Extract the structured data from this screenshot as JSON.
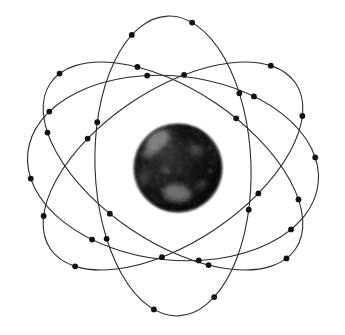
{
  "figure": {
    "kind": "rutherford-bohr-atom",
    "background_color": "#ffffff",
    "canvas": {
      "width": 345,
      "height": 335
    }
  },
  "nucleus": {
    "label": "nucleus",
    "center_x": 178,
    "center_y": 168,
    "radius": 44,
    "fill_color": "#141414",
    "highlight_color": "#9a9a9a",
    "texture": "mottled-grainy-sphere",
    "highlights": [
      {
        "cx": 158,
        "cy": 140,
        "rx": 13,
        "ry": 9,
        "rot": -35,
        "opacity": 0.42
      },
      {
        "cx": 150,
        "cy": 152,
        "rx": 8,
        "ry": 5,
        "rot": -20,
        "opacity": 0.3
      },
      {
        "cx": 177,
        "cy": 193,
        "rx": 14,
        "ry": 9,
        "rot": 8,
        "opacity": 0.38
      },
      {
        "cx": 196,
        "cy": 150,
        "rx": 7,
        "ry": 5,
        "rot": 30,
        "opacity": 0.2
      },
      {
        "cx": 165,
        "cy": 170,
        "rx": 5,
        "ry": 4,
        "rot": 0,
        "opacity": 0.16
      },
      {
        "cx": 200,
        "cy": 185,
        "rx": 6,
        "ry": 4,
        "rot": -15,
        "opacity": 0.18
      },
      {
        "cx": 144,
        "cy": 178,
        "rx": 5,
        "ry": 9,
        "rot": 10,
        "opacity": 0.14
      }
    ],
    "shadows": [
      {
        "cx": 190,
        "cy": 133,
        "rx": 16,
        "ry": 10,
        "rot": 15,
        "opacity": 0.5
      },
      {
        "cx": 205,
        "cy": 172,
        "rx": 13,
        "ry": 18,
        "rot": 0,
        "opacity": 0.45
      },
      {
        "cx": 168,
        "cy": 206,
        "rx": 18,
        "ry": 8,
        "rot": -5,
        "opacity": 0.4
      }
    ]
  },
  "orbits": [
    {
      "name": "orbit-1",
      "stroke_color": "#2b2b2b",
      "stroke_width": 1.1,
      "cx": 173,
      "cy": 166,
      "rx": 150,
      "ry": 78,
      "rotation_deg": 88,
      "electron_count": 8,
      "electrons": [
        {
          "t": 18
        },
        {
          "t": 62
        },
        {
          "t": 108
        },
        {
          "t": 152
        },
        {
          "t": 198
        },
        {
          "t": 242
        },
        {
          "t": 288
        },
        {
          "t": 332
        }
      ]
    },
    {
      "name": "orbit-2",
      "stroke_color": "#2b2b2b",
      "stroke_width": 1.1,
      "cx": 173,
      "cy": 166,
      "rx": 148,
      "ry": 76,
      "rotation_deg": 34,
      "electron_count": 8,
      "electrons": [
        {
          "t": 10
        },
        {
          "t": 55
        },
        {
          "t": 100
        },
        {
          "t": 146
        },
        {
          "t": 190
        },
        {
          "t": 235
        },
        {
          "t": 280
        },
        {
          "t": 326
        }
      ]
    },
    {
      "name": "orbit-3",
      "stroke_color": "#2b2b2b",
      "stroke_width": 1.1,
      "cx": 173,
      "cy": 166,
      "rx": 148,
      "ry": 76,
      "rotation_deg": 146,
      "electron_count": 8,
      "electrons": [
        {
          "t": 24
        },
        {
          "t": 68
        },
        {
          "t": 114
        },
        {
          "t": 158
        },
        {
          "t": 204
        },
        {
          "t": 248
        },
        {
          "t": 294
        },
        {
          "t": 338
        }
      ]
    },
    {
      "name": "orbit-4",
      "stroke_color": "#2b2b2b",
      "stroke_width": 1.1,
      "cx": 173,
      "cy": 168,
      "rx": 146,
      "ry": 92,
      "rotation_deg": 6,
      "electron_count": 8,
      "electrons": [
        {
          "t": 32
        },
        {
          "t": 76
        },
        {
          "t": 120
        },
        {
          "t": 164
        },
        {
          "t": 208
        },
        {
          "t": 256
        },
        {
          "t": 300
        },
        {
          "t": 344
        }
      ]
    }
  ],
  "electron_style": {
    "label": "electron",
    "radius": 2.9,
    "fill_color": "#111111"
  }
}
